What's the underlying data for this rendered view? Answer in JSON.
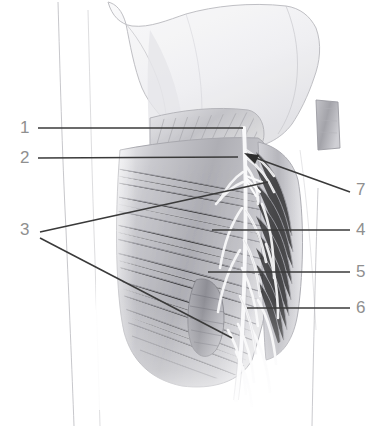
{
  "figure": {
    "kind": "anatomical-illustration",
    "background_color": "#ffffff",
    "label_color": "#8f8f8f",
    "leader_color": "#3a3a3a",
    "outline_color": "#a9a9ae",
    "muscle_tone_dark": "#9a9a9e",
    "muscle_tone_mid": "#c2c2c6",
    "muscle_tone_light": "#e2e2e5",
    "bone_tone": "#ededf0",
    "nerve_tone": "#fbfbfc"
  },
  "labels": [
    {
      "id": "1",
      "text": "1",
      "side": "left",
      "x": 22,
      "y": 120
    },
    {
      "id": "2",
      "text": "2",
      "side": "left",
      "x": 22,
      "y": 150
    },
    {
      "id": "3",
      "text": "3",
      "side": "left",
      "x": 22,
      "y": 222
    },
    {
      "id": "7",
      "text": "7",
      "side": "right",
      "x": 358,
      "y": 182
    },
    {
      "id": "4",
      "text": "4",
      "side": "right",
      "x": 358,
      "y": 222
    },
    {
      "id": "5",
      "text": "5",
      "side": "right",
      "x": 358,
      "y": 264
    },
    {
      "id": "6",
      "text": "6",
      "side": "right",
      "x": 358,
      "y": 300
    }
  ],
  "leaders": [
    {
      "for": "1",
      "type": "line",
      "points": "38,128 243,128"
    },
    {
      "for": "2",
      "type": "line",
      "points": "38,158 238,157"
    },
    {
      "for": "3",
      "type": "line",
      "points": "40,232 268,182"
    },
    {
      "for": "3b",
      "type": "line",
      "points": "40,238 232,338"
    },
    {
      "for": "7",
      "type": "arrow",
      "points": "350,192 246,155"
    },
    {
      "for": "4",
      "type": "line",
      "points": "350,230 212,230"
    },
    {
      "for": "5",
      "type": "line",
      "points": "350,272 208,272"
    },
    {
      "for": "6",
      "type": "line",
      "points": "350,308 247,308"
    }
  ]
}
